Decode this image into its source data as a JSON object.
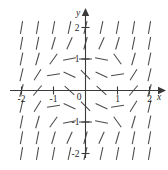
{
  "figure": {
    "kind": "slope-field",
    "x_axis_label": "x",
    "y_axis_label": "y",
    "origin_label": "0"
  },
  "chart_data": {
    "type": "scatter",
    "title": "",
    "subtitle": "",
    "xlabel": "x",
    "ylabel": "y",
    "xlim": [
      -2.35,
      2.35
    ],
    "ylim": [
      -2.35,
      2.35
    ],
    "grid": false,
    "legend": null,
    "x_ticks": [
      -2,
      -1,
      1,
      2
    ],
    "x_tick_labels": [
      "-2",
      "-1",
      "1",
      "2"
    ],
    "y_ticks": [
      -2,
      -1,
      1,
      2
    ],
    "y_tick_labels": [
      "-2",
      "-1",
      "1",
      "2"
    ],
    "origin_label": "0",
    "x_axis_arrow": true,
    "y_axis_arrow": true,
    "grid_x": [
      -2,
      -1.5,
      -1,
      -0.5,
      0,
      0.5,
      1,
      1.5,
      2
    ],
    "grid_y": [
      -2,
      -1.5,
      -1,
      -0.5,
      0,
      0.5,
      1,
      1.5,
      2
    ],
    "segment_length": 13,
    "slopes": [
      {
        "y": 2.0,
        "values": [
          6.0,
          6.0,
          5.4,
          4.6,
          4.0,
          4.6,
          5.4,
          6.0,
          6.0
        ]
      },
      {
        "y": 1.5,
        "values": [
          5.6,
          5.0,
          3.4,
          2.2,
          3.6,
          2.2,
          3.4,
          5.0,
          5.6
        ]
      },
      {
        "y": 1.0,
        "values": [
          5.0,
          3.4,
          1.4,
          0.18,
          0.0,
          -0.18,
          -1.4,
          3.4,
          5.0
        ]
      },
      {
        "y": 0.5,
        "values": [
          4.2,
          1.6,
          0.15,
          -0.45,
          -1.0,
          -0.45,
          0.15,
          1.6,
          4.2
        ]
      },
      {
        "y": 0.0,
        "values": [
          3.6,
          1.2,
          0.0,
          -0.9,
          0.0,
          -0.9,
          0.0,
          1.2,
          3.6
        ]
      },
      {
        "y": -0.5,
        "values": [
          4.2,
          1.6,
          0.15,
          -0.45,
          -1.0,
          -0.45,
          0.15,
          1.6,
          4.2
        ]
      },
      {
        "y": -1.0,
        "values": [
          5.0,
          3.4,
          1.4,
          0.18,
          0.0,
          -0.18,
          -1.4,
          3.4,
          5.0
        ]
      },
      {
        "y": -1.5,
        "values": [
          5.6,
          5.0,
          3.4,
          2.2,
          3.6,
          2.2,
          3.4,
          5.0,
          5.6
        ]
      },
      {
        "y": -2.0,
        "values": [
          6.0,
          6.0,
          5.4,
          4.6,
          4.0,
          4.6,
          5.4,
          6.0,
          6.0
        ]
      }
    ],
    "colors": {
      "segment": "#4a4a4a",
      "axis": "#3a3a3a",
      "label": "#1f1f1f",
      "background": "#ffffff"
    }
  }
}
